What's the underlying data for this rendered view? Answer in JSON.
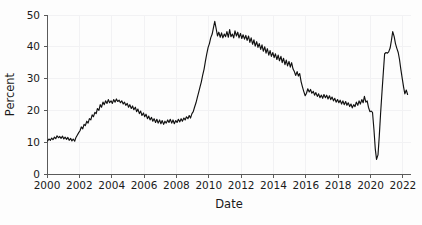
{
  "chart_data": {
    "type": "line",
    "title": "",
    "xlabel": "Date",
    "ylabel": "Percent",
    "xlim": [
      2000,
      2022.5
    ],
    "ylim": [
      0,
      50
    ],
    "grid": true,
    "legend": null,
    "xticks": [
      2000,
      2002,
      2004,
      2006,
      2008,
      2010,
      2012,
      2014,
      2016,
      2018,
      2020,
      2022
    ],
    "xtick_labels": [
      "2000",
      "2002",
      "2004",
      "2006",
      "2008",
      "2010",
      "2012",
      "2014",
      "2016",
      "2018",
      "2020",
      "2022"
    ],
    "yticks": [
      0,
      10,
      20,
      30,
      40,
      50
    ],
    "ytick_labels": [
      "0",
      "10",
      "20",
      "30",
      "40",
      "50"
    ],
    "line_color": "#111111",
    "series": [
      {
        "name": "Percent",
        "x": [
          2000.04,
          2000.12,
          2000.21,
          2000.29,
          2000.37,
          2000.46,
          2000.54,
          2000.62,
          2000.71,
          2000.79,
          2000.87,
          2000.96,
          2001.04,
          2001.12,
          2001.21,
          2001.29,
          2001.37,
          2001.46,
          2001.54,
          2001.62,
          2001.71,
          2001.79,
          2001.87,
          2001.96,
          2002.04,
          2002.12,
          2002.21,
          2002.29,
          2002.37,
          2002.46,
          2002.54,
          2002.62,
          2002.71,
          2002.79,
          2002.87,
          2002.96,
          2003.04,
          2003.12,
          2003.21,
          2003.29,
          2003.37,
          2003.46,
          2003.54,
          2003.62,
          2003.71,
          2003.79,
          2003.87,
          2003.96,
          2004.04,
          2004.12,
          2004.21,
          2004.29,
          2004.37,
          2004.46,
          2004.54,
          2004.62,
          2004.71,
          2004.79,
          2004.87,
          2004.96,
          2005.04,
          2005.12,
          2005.21,
          2005.29,
          2005.37,
          2005.46,
          2005.54,
          2005.62,
          2005.71,
          2005.79,
          2005.87,
          2005.96,
          2006.04,
          2006.12,
          2006.21,
          2006.29,
          2006.37,
          2006.46,
          2006.54,
          2006.62,
          2006.71,
          2006.79,
          2006.87,
          2006.96,
          2007.04,
          2007.12,
          2007.21,
          2007.29,
          2007.37,
          2007.46,
          2007.54,
          2007.62,
          2007.71,
          2007.79,
          2007.87,
          2007.96,
          2008.04,
          2008.12,
          2008.21,
          2008.29,
          2008.37,
          2008.46,
          2008.54,
          2008.62,
          2008.71,
          2008.79,
          2008.87,
          2008.96,
          2009.04,
          2009.12,
          2009.21,
          2009.29,
          2009.37,
          2009.46,
          2009.54,
          2009.62,
          2009.71,
          2009.79,
          2009.87,
          2009.96,
          2010.04,
          2010.12,
          2010.21,
          2010.29,
          2010.37,
          2010.46,
          2010.54,
          2010.62,
          2010.71,
          2010.79,
          2010.87,
          2010.96,
          2011.04,
          2011.12,
          2011.21,
          2011.29,
          2011.37,
          2011.46,
          2011.54,
          2011.62,
          2011.71,
          2011.79,
          2011.87,
          2011.96,
          2012.04,
          2012.12,
          2012.21,
          2012.29,
          2012.37,
          2012.46,
          2012.54,
          2012.62,
          2012.71,
          2012.79,
          2012.87,
          2012.96,
          2013.04,
          2013.12,
          2013.21,
          2013.29,
          2013.37,
          2013.46,
          2013.54,
          2013.62,
          2013.71,
          2013.79,
          2013.87,
          2013.96,
          2014.04,
          2014.12,
          2014.21,
          2014.29,
          2014.37,
          2014.46,
          2014.54,
          2014.62,
          2014.71,
          2014.79,
          2014.87,
          2014.96,
          2015.04,
          2015.12,
          2015.21,
          2015.29,
          2015.37,
          2015.46,
          2015.54,
          2015.62,
          2015.71,
          2015.79,
          2015.87,
          2015.96,
          2016.04,
          2016.12,
          2016.21,
          2016.29,
          2016.37,
          2016.46,
          2016.54,
          2016.62,
          2016.71,
          2016.79,
          2016.87,
          2016.96,
          2017.04,
          2017.12,
          2017.21,
          2017.29,
          2017.37,
          2017.46,
          2017.54,
          2017.62,
          2017.71,
          2017.79,
          2017.87,
          2017.96,
          2018.04,
          2018.12,
          2018.21,
          2018.29,
          2018.37,
          2018.46,
          2018.54,
          2018.62,
          2018.71,
          2018.79,
          2018.87,
          2018.96,
          2019.04,
          2019.12,
          2019.21,
          2019.29,
          2019.37,
          2019.46,
          2019.54,
          2019.62,
          2019.71,
          2019.79,
          2019.87,
          2019.96,
          2020.04,
          2020.12,
          2020.21,
          2020.29,
          2020.37,
          2020.46,
          2020.54,
          2020.62,
          2020.71,
          2020.79,
          2020.87,
          2020.96,
          2021.04,
          2021.12,
          2021.21,
          2021.29,
          2021.37,
          2021.46,
          2021.54,
          2021.62,
          2021.71,
          2021.79,
          2021.87,
          2021.96,
          2022.04,
          2022.12,
          2022.21,
          2022.29
        ],
        "values": [
          10.4,
          11.0,
          10.6,
          11.3,
          10.8,
          11.6,
          11.1,
          12.0,
          11.4,
          11.8,
          11.2,
          11.9,
          11.0,
          11.6,
          10.9,
          11.5,
          10.6,
          11.2,
          10.4,
          11.0,
          10.3,
          11.5,
          12.2,
          13.0,
          13.6,
          14.8,
          14.2,
          15.6,
          15.2,
          16.6,
          16.0,
          17.4,
          17.0,
          18.6,
          18.0,
          19.4,
          19.0,
          20.6,
          20.0,
          21.8,
          21.0,
          22.6,
          21.8,
          23.0,
          22.2,
          23.4,
          22.4,
          23.0,
          22.2,
          23.4,
          22.6,
          23.6,
          22.8,
          23.2,
          22.4,
          23.0,
          22.0,
          22.6,
          21.6,
          22.2,
          21.0,
          21.8,
          20.6,
          21.4,
          20.2,
          21.0,
          19.6,
          20.4,
          19.0,
          19.8,
          18.4,
          19.2,
          18.0,
          18.8,
          17.4,
          18.2,
          17.0,
          17.8,
          16.6,
          17.4,
          16.2,
          17.2,
          16.0,
          17.0,
          15.8,
          16.8,
          15.6,
          16.6,
          16.0,
          17.0,
          16.2,
          17.2,
          16.0,
          17.0,
          15.8,
          16.8,
          16.2,
          17.2,
          16.4,
          17.4,
          16.6,
          17.6,
          17.0,
          18.0,
          17.4,
          18.4,
          17.6,
          19.0,
          19.6,
          21.0,
          22.4,
          24.0,
          25.6,
          27.4,
          29.0,
          31.0,
          33.0,
          35.4,
          37.6,
          39.8,
          41.0,
          42.8,
          44.0,
          46.0,
          48.0,
          45.6,
          43.4,
          44.6,
          43.0,
          44.4,
          42.8,
          44.0,
          43.2,
          44.8,
          43.0,
          45.4,
          43.2,
          44.0,
          42.8,
          45.0,
          43.4,
          44.6,
          42.8,
          44.2,
          42.6,
          43.8,
          42.4,
          43.6,
          42.0,
          43.4,
          41.4,
          42.8,
          40.8,
          42.2,
          40.2,
          41.6,
          39.8,
          41.0,
          39.2,
          40.6,
          38.6,
          40.0,
          38.0,
          39.4,
          37.4,
          38.8,
          37.0,
          38.2,
          36.6,
          37.8,
          36.0,
          37.4,
          35.6,
          37.0,
          35.0,
          36.4,
          34.4,
          35.8,
          34.0,
          35.4,
          33.6,
          35.0,
          33.0,
          32.2,
          31.0,
          32.2,
          30.8,
          31.6,
          29.0,
          27.4,
          26.0,
          24.6,
          25.4,
          26.8,
          25.8,
          26.6,
          25.4,
          26.0,
          24.8,
          25.6,
          24.4,
          25.2,
          24.0,
          24.8,
          23.8,
          25.0,
          24.0,
          24.8,
          23.6,
          24.6,
          23.4,
          24.2,
          23.0,
          23.8,
          22.6,
          23.4,
          22.4,
          23.2,
          22.0,
          23.0,
          21.8,
          22.8,
          21.6,
          22.4,
          21.2,
          22.0,
          20.8,
          21.8,
          21.2,
          22.6,
          21.6,
          23.0,
          22.0,
          23.4,
          22.4,
          24.4,
          22.6,
          23.0,
          21.0,
          19.6,
          19.8,
          19.4,
          14.0,
          8.0,
          4.6,
          6.0,
          12.0,
          19.0,
          26.0,
          32.0,
          37.8,
          38.2,
          38.0,
          38.4,
          39.6,
          42.0,
          44.8,
          43.2,
          41.0,
          39.6,
          38.2,
          36.0,
          33.0,
          30.0,
          27.4,
          25.2,
          26.4,
          25.0
        ]
      }
    ]
  },
  "axes": {
    "ylabel": "Percent",
    "xlabel": "Date"
  }
}
